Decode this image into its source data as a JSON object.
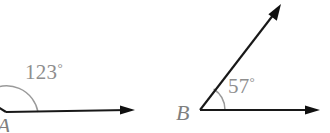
{
  "figure": {
    "type": "geometry-diagram",
    "background_color": "#ffffff",
    "width": 330,
    "height": 132,
    "ray_color": "#181818",
    "arc_color": "#9a9a9a",
    "label_color": "#8e8e8e",
    "vertex_label_color": "#7f7f7f"
  },
  "angles": [
    {
      "id": "angle-a",
      "vertex_label": "A",
      "measure_value": "123",
      "degree_symbol": "°",
      "measure_label": "123°",
      "vertex_x": 6,
      "vertex_y": 112,
      "arc_radius": 32,
      "label_x": 25,
      "label_y": 79,
      "vertex_label_x": -3,
      "vertex_label_y": 131,
      "rays": [
        {
          "name": "horizontal-ray-a",
          "from_x": 6,
          "from_y": 112,
          "to_x": 135,
          "to_y": 110,
          "arrow": true
        },
        {
          "name": "upper-left-ray-a",
          "from_x": 6,
          "from_y": 112,
          "to_x": -22,
          "to_y": 94,
          "arrow": false
        }
      ]
    },
    {
      "id": "angle-b",
      "vertex_label": "B",
      "measure_value": "57",
      "degree_symbol": "°",
      "measure_label": "57°",
      "vertex_x": 200,
      "vertex_y": 110,
      "arc_radius": 25,
      "label_x": 228,
      "label_y": 93,
      "vertex_label_x": 176,
      "vertex_label_y": 120,
      "rays": [
        {
          "name": "horizontal-ray-b",
          "from_x": 200,
          "from_y": 110,
          "to_x": 320,
          "to_y": 110,
          "arrow": true
        },
        {
          "name": "diagonal-ray-b",
          "from_x": 200,
          "from_y": 110,
          "to_x": 281,
          "to_y": 5,
          "arrow": true
        }
      ]
    }
  ]
}
